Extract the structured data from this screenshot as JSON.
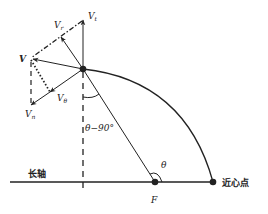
{
  "labels": {
    "v_t": {
      "main": "V",
      "sub": "t"
    },
    "v_r": {
      "main": "V",
      "sub": "r"
    },
    "v": "V",
    "v_theta": {
      "main": "V",
      "sub": "θ"
    },
    "v_n": {
      "main": "V",
      "sub": "n"
    },
    "angle_theta_minus_90": "θ−90°",
    "theta": "θ",
    "focus": "F",
    "major_axis": "长轴",
    "perihelion": "近心点"
  },
  "colors": {
    "stroke": "#222222",
    "background": "#ffffff"
  }
}
